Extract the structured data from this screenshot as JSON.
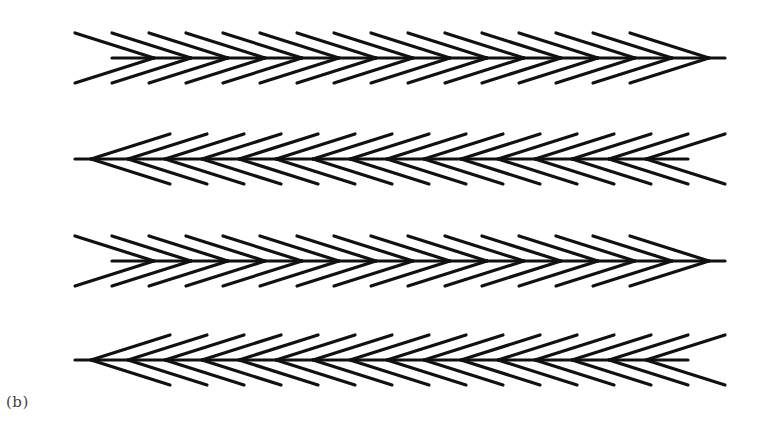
{
  "figure": {
    "panel_label": "(b)",
    "stroke_color": "#111111",
    "background": "#ffffff",
    "chevrons_per_row": 16,
    "chevron_spacing_px": 37,
    "arm_length_x_px": 79,
    "arm_spread_y_px": 25,
    "rows": [
      {
        "index": 1,
        "direction": "right",
        "center_y": 58,
        "x_start": 75,
        "x_end": 725
      },
      {
        "index": 2,
        "direction": "left",
        "center_y": 159,
        "x_start": 75,
        "x_end": 725
      },
      {
        "index": 3,
        "direction": "right",
        "center_y": 261,
        "x_start": 75,
        "x_end": 725
      },
      {
        "index": 4,
        "direction": "left",
        "center_y": 360,
        "x_start": 75,
        "x_end": 725
      }
    ]
  }
}
